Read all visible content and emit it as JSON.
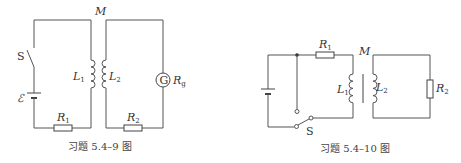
{
  "figures": [
    {
      "caption": "习题 5.4–9 图",
      "labels": {
        "mutual": "M",
        "switch": "S",
        "emf": "ℰ",
        "L1": "L",
        "L1_sub": "1",
        "L2": "L",
        "L2_sub": "2",
        "R1": "R",
        "R1_sub": "1",
        "R2": "R",
        "R2_sub": "2",
        "G": "G",
        "Rg": "R",
        "Rg_sub": "g"
      }
    },
    {
      "caption": "习题 5.4–10 图",
      "labels": {
        "mutual": "M",
        "switch": "S",
        "L1": "L",
        "L1_sub": "1",
        "L2": "L",
        "L2_sub": "2",
        "R1": "R",
        "R1_sub": "1",
        "R2": "R",
        "R2_sub": "2"
      }
    }
  ]
}
